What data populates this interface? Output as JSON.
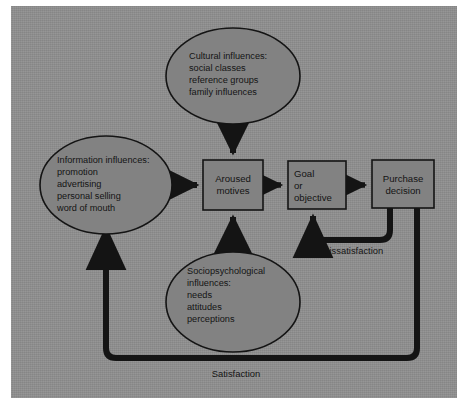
{
  "figure": {
    "panel_color": "#8d8d8d",
    "shape_fill": "#828282",
    "stroke_color": "#141414",
    "text_color": "#141414"
  },
  "diagram": {
    "type": "flowchart",
    "nodes": [
      {
        "id": "cultural",
        "shape": "ellipse",
        "lines": [
          "Cultural influences:",
          "social classes",
          "reference groups",
          "family influences"
        ]
      },
      {
        "id": "information",
        "shape": "ellipse",
        "lines": [
          "Information influences:",
          "promotion",
          "advertising",
          "personal selling",
          "word of mouth"
        ]
      },
      {
        "id": "sociopsychological",
        "shape": "ellipse",
        "lines": [
          "Sociopsychological",
          "influences:",
          "needs",
          "attitudes",
          "perceptions"
        ]
      },
      {
        "id": "aroused-motives",
        "shape": "rectangle",
        "lines": [
          "Aroused",
          "motives"
        ]
      },
      {
        "id": "goal-objective",
        "shape": "rectangle",
        "lines": [
          "Goal",
          "or",
          "objective"
        ]
      },
      {
        "id": "purchase-decision",
        "shape": "rectangle",
        "lines": [
          "Purchase",
          "decision"
        ]
      }
    ],
    "edges": [
      {
        "id": "cultural-to-motives",
        "from": "cultural",
        "to": "aroused-motives",
        "label": ""
      },
      {
        "id": "information-to-motives",
        "from": "information",
        "to": "aroused-motives",
        "label": ""
      },
      {
        "id": "sociopsychological-to-motives",
        "from": "sociopsychological",
        "to": "aroused-motives",
        "label": ""
      },
      {
        "id": "motives-to-goal",
        "from": "aroused-motives",
        "to": "goal-objective",
        "label": ""
      },
      {
        "id": "goal-to-purchase",
        "from": "goal-objective",
        "to": "purchase-decision",
        "label": ""
      },
      {
        "id": "dissatisfaction-loop",
        "from": "purchase-decision",
        "to": "goal-objective",
        "label": "Dissatisfaction"
      },
      {
        "id": "satisfaction-loop",
        "from": "purchase-decision",
        "to": "information",
        "label": "Satisfaction"
      }
    ],
    "labels": {
      "dissatisfaction": "Dissatisfaction",
      "satisfaction": "Satisfaction"
    }
  }
}
